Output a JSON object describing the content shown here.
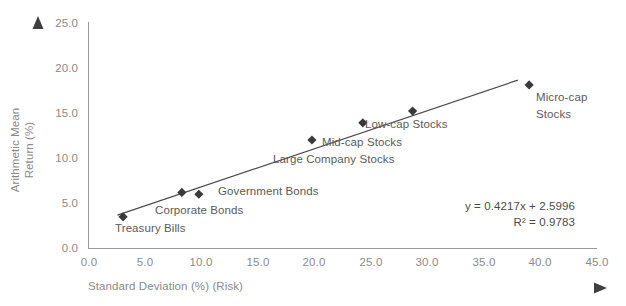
{
  "chart_data": {
    "type": "scatter",
    "title": "",
    "xlabel": "Standard Deviation (%) (Risk)",
    "ylabel": "Arithmetic Mean Return (%)",
    "ylabel_line1": "Arithmetic Mean",
    "ylabel_line2": "Return (%)",
    "xlim": [
      0.0,
      45.0
    ],
    "ylim": [
      0.0,
      25.0
    ],
    "xticks": [
      "0.0",
      "5.0",
      "10.0",
      "15.0",
      "20.0",
      "25.0",
      "30.0",
      "35.0",
      "40.0",
      "45.0"
    ],
    "yticks": [
      "0.0",
      "5.0",
      "10.0",
      "15.0",
      "20.0",
      "25.0"
    ],
    "grid": false,
    "legend": "none",
    "points": [
      {
        "label": "Treasury Bills",
        "x": 3.1,
        "y": 3.5
      },
      {
        "label": "Corporate Bonds",
        "x": 8.3,
        "y": 6.2
      },
      {
        "label": "Government Bonds",
        "x": 9.8,
        "y": 6.0
      },
      {
        "label": "Large Company Stocks",
        "x": 19.8,
        "y": 12.0
      },
      {
        "label": "Mid-cap Stocks",
        "x": 24.3,
        "y": 13.9
      },
      {
        "label": "Low-cap Stocks",
        "x": 28.7,
        "y": 15.2
      },
      {
        "label": "Micro-cap Stocks",
        "x": 39.0,
        "y": 18.1
      }
    ],
    "trendline": {
      "equation": "y = 0.4217x + 2.5996",
      "r_squared": "R² = 0.9783",
      "slope": 0.4217,
      "intercept": 2.5996,
      "x_start": 2.6,
      "x_end": 38.0
    },
    "annotations": {
      "risk_arrow": "increasing-risk-arrow",
      "return_arrow": "increasing-return-arrow"
    },
    "colors": {
      "marker": "#3a3a3a",
      "trendline": "#4a4a4a",
      "axis": "#9a9a9a",
      "tick_text": "#8a8a8a",
      "label_text": "#5a5a5a",
      "arrow_dark": "#3f3f3f",
      "arrow_light": "#f2f2f2"
    }
  },
  "point_labels": {
    "treasury_bills": "Treasury Bills",
    "corporate_bonds": "Corporate Bonds",
    "government_bonds": "Government Bonds",
    "large_company_stocks": "Large Company Stocks",
    "midcap_stocks": "Mid-cap Stocks",
    "lowcap_stocks": "Low-cap Stocks",
    "microcap_stocks_line1": "Micro-cap",
    "microcap_stocks_line2": "Stocks"
  }
}
